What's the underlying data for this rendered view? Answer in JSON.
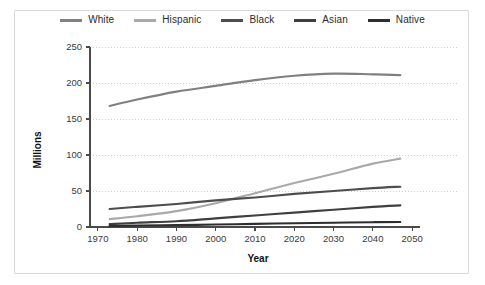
{
  "chart_data": {
    "type": "line",
    "title": "",
    "xlabel": "Year",
    "ylabel": "Millions",
    "xlim": [
      1968,
      2052
    ],
    "ylim": [
      0,
      250
    ],
    "grid": true,
    "legend_position": "top-center",
    "x_ticks": [
      "1970",
      "1980",
      "1990",
      "2000",
      "2010",
      "2020",
      "2030",
      "2040",
      "2050"
    ],
    "y_ticks": [
      "0",
      "50",
      "100",
      "150",
      "200",
      "250"
    ],
    "x": [
      1973,
      1980,
      1990,
      2000,
      2010,
      2020,
      2030,
      2040,
      2047
    ],
    "series": [
      {
        "name": "White",
        "color": "#808080",
        "values": [
          168,
          177,
          188,
          196,
          204,
          210,
          213,
          212,
          211
        ]
      },
      {
        "name": "Hispanic",
        "color": "#a9a9a9",
        "values": [
          11,
          15,
          22,
          33,
          47,
          61,
          74,
          88,
          95
        ]
      },
      {
        "name": "Black",
        "color": "#4d4d4d",
        "values": [
          25,
          28,
          32,
          37,
          41,
          46,
          50,
          54,
          56
        ]
      },
      {
        "name": "Asian",
        "color": "#3f3f3f",
        "values": [
          4,
          6,
          8,
          12,
          16,
          20,
          24,
          28,
          30
        ]
      },
      {
        "name": "Native",
        "color": "#2e2e2e",
        "values": [
          1.5,
          2,
          2.6,
          3.4,
          4.3,
          5.2,
          6,
          6.7,
          7
        ]
      }
    ]
  },
  "legend": {
    "items": [
      {
        "label": "White",
        "color": "#808080"
      },
      {
        "label": "Hispanic",
        "color": "#a9a9a9"
      },
      {
        "label": "Black",
        "color": "#4d4d4d"
      },
      {
        "label": "Asian",
        "color": "#3f3f3f"
      },
      {
        "label": "Native",
        "color": "#2e2e2e"
      }
    ]
  }
}
